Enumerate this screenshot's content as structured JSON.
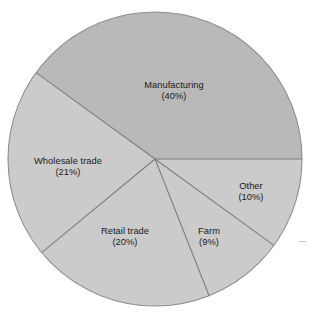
{
  "chart_data": {
    "type": "pie",
    "title": "",
    "subtitle": "",
    "xlabel": "",
    "ylabel": "",
    "legend_position": "none",
    "grid": false,
    "labels_inside": true,
    "start_angle_deg": 0,
    "direction": "counterclockwise",
    "categories": [
      "Manufacturing",
      "Wholesale trade",
      "Retail trade",
      "Farm",
      "Other"
    ],
    "values": [
      40,
      21,
      20,
      9,
      10
    ],
    "value_unit": "percent",
    "slices": [
      {
        "name": "Manufacturing",
        "value": 40,
        "pct_text": "(40%)",
        "sweep_deg": 144,
        "start_deg": 0,
        "end_deg": 144,
        "color": "#b9b9b9",
        "label_x": 174,
        "label_y": 91
      },
      {
        "name": "Wholesale trade",
        "value": 21,
        "pct_text": "(21%)",
        "sweep_deg": 75.6,
        "start_deg": 144,
        "end_deg": 219.6,
        "color": "#cbcbcb",
        "label_x": 68,
        "label_y": 167
      },
      {
        "name": "Retail trade",
        "value": 20,
        "pct_text": "(20%)",
        "sweep_deg": 72,
        "start_deg": 219.6,
        "end_deg": 291.6,
        "color": "#cbcbcb",
        "label_x": 125,
        "label_y": 237
      },
      {
        "name": "Farm",
        "value": 9,
        "pct_text": "(9%)",
        "sweep_deg": 32.4,
        "start_deg": 291.6,
        "end_deg": 324,
        "color": "#cbcbcb",
        "label_x": 209,
        "label_y": 237
      },
      {
        "name": "Other",
        "value": 10,
        "pct_text": "(10%)",
        "sweep_deg": 36,
        "start_deg": 324,
        "end_deg": 360,
        "color": "#cbcbcb",
        "label_x": 251,
        "label_y": 192
      }
    ],
    "geometry": {
      "center_x": 155,
      "center_y": 159,
      "radius": 147
    },
    "colors": {
      "background": "#ffffff",
      "slice_default": "#cbcbcb",
      "slice_highlight": "#b9b9b9",
      "outline": "#8f8f8f",
      "divider": "#7d7d7d",
      "label_text": "#1a1a1a"
    }
  }
}
